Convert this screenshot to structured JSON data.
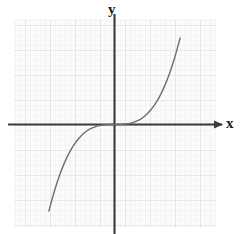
{
  "figure": {
    "kind": "cartesian-graph",
    "background_color": "#ffffff"
  },
  "labels": {
    "y_axis": "y",
    "x_axis": "x"
  },
  "chart_data": {
    "type": "line",
    "title": "",
    "subtitle": "",
    "xlabel": "x",
    "ylabel": "y",
    "grid": true,
    "grid_minor": true,
    "legend": false,
    "legend_position": "none",
    "xlim": [
      -5,
      5
    ],
    "ylim": [
      -5,
      5
    ],
    "xticks": [
      -5,
      -4,
      -3,
      -2,
      -1,
      0,
      1,
      2,
      3,
      4,
      5
    ],
    "yticks": [
      -5,
      -4,
      -3,
      -2,
      -1,
      0,
      1,
      2,
      3,
      4,
      5
    ],
    "xtick_labels": [
      "",
      "",
      "",
      "",
      "",
      "",
      "",
      "",
      "",
      "",
      ""
    ],
    "ytick_labels": [
      "",
      "",
      "",
      "",
      "",
      "",
      "",
      "",
      "",
      "",
      ""
    ],
    "tick_labels_shown": false,
    "axis_arrow_positive_x": true,
    "origin": [
      0,
      0
    ],
    "series": [
      {
        "name": "cubic",
        "equation": "y = x^3 / 8",
        "color": "#6e6e6e",
        "linewidth": 1.4,
        "x": [
          -3.5,
          -3.25,
          -3.0,
          -2.75,
          -2.5,
          -2.25,
          -2.0,
          -1.75,
          -1.5,
          -1.25,
          -1.0,
          -0.75,
          -0.5,
          -0.25,
          0.0,
          0.25,
          0.5,
          0.75,
          1.0,
          1.25,
          1.5,
          1.75,
          2.0,
          2.25,
          2.5,
          2.75,
          3.0,
          3.25,
          3.5,
          3.75,
          3.9
        ],
        "values": [
          -5.36,
          -4.29,
          -3.38,
          -2.6,
          -1.95,
          -1.42,
          -1.0,
          -0.67,
          -0.42,
          -0.24,
          -0.13,
          -0.05,
          -0.02,
          0.0,
          0.0,
          0.0,
          0.02,
          0.05,
          0.13,
          0.24,
          0.42,
          0.67,
          1.0,
          1.42,
          1.95,
          2.6,
          3.38,
          4.29,
          5.36,
          6.59,
          7.41
        ]
      }
    ],
    "annotations": []
  },
  "style": {
    "axis_color": "#3b3b3b",
    "curve_color": "#6e6e6e",
    "grid_major_color": "#dcdcdc",
    "grid_minor_color": "#ededed",
    "plot_background": "#fbfbfb",
    "label_color": "#1c1c1c"
  }
}
